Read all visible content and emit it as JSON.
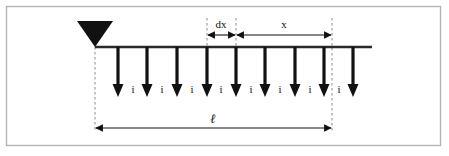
{
  "figure": {
    "frame": {
      "stroke_color": "#b4b4b4",
      "fill_color": "#ffffff",
      "x": 6,
      "y": 6,
      "width": 435,
      "height": 140
    },
    "colors": {
      "ink": "#111111",
      "line": "#2a2a2a",
      "dashed": "#8a8a8a",
      "frame": "#b4b4b4",
      "background": "#ffffff"
    },
    "ground_line": {
      "label": "ground-surface-line",
      "x_start": 95,
      "x_end": 372,
      "y": 47,
      "stroke_width": 2.2
    },
    "water_table_symbol": {
      "label": "water-table-triangle",
      "apex_x": 95,
      "apex_y": 47,
      "half_width": 18,
      "top_y": 21
    },
    "infiltration": {
      "symbol": "i",
      "count": 9,
      "arrow_top_y": 47,
      "arrow_tip_y": 97,
      "arrow_stroke_width": 3.2,
      "arrow_head_width": 11,
      "arrow_head_height": 13,
      "x_positions": [
        118,
        147,
        177,
        207,
        236,
        265,
        295,
        324,
        353
      ],
      "label_y": 92,
      "label_x_positions": [
        133,
        162,
        192,
        221,
        251,
        280,
        310,
        339
      ],
      "labels": [
        "i",
        "i",
        "i",
        "i",
        "i",
        "i",
        "i",
        "i"
      ]
    },
    "dimensions": [
      {
        "name": "dx",
        "label": "dx",
        "x_start": 207,
        "x_end": 236,
        "y": 35,
        "label_x": 221,
        "label_y": 27,
        "arrow_left": true,
        "arrow_right": true
      },
      {
        "name": "x",
        "label": "x",
        "x_start": 236,
        "x_end": 332,
        "y": 35,
        "label_x": 284,
        "label_y": 27,
        "arrow_left": true,
        "arrow_right": true
      },
      {
        "name": "ell",
        "label": "ℓ",
        "x_start": 95,
        "x_end": 332,
        "y": 128,
        "label_x": 213,
        "label_y": 121,
        "arrow_left": true,
        "arrow_right": true
      }
    ],
    "dashed_guides": [
      {
        "name": "left-extent-guide",
        "x": 95,
        "y_top": 47,
        "y_bottom": 131
      },
      {
        "name": "dx-left-guide",
        "x": 207,
        "y_top": 18,
        "y_bottom": 52
      },
      {
        "name": "dx-right-guide",
        "x": 236,
        "y_top": 18,
        "y_bottom": 52
      },
      {
        "name": "right-extent-guide",
        "x": 332,
        "y_top": 18,
        "y_bottom": 131
      }
    ]
  }
}
